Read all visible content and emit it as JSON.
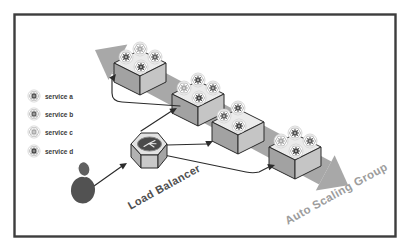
{
  "diagram": {
    "type": "architecture-diagram",
    "legend": {
      "items": [
        {
          "id": "service-a",
          "label": "service a",
          "gear_color": "#4f4f4f"
        },
        {
          "id": "service-b",
          "label": "service b",
          "gear_color": "#5e5e5e"
        },
        {
          "id": "service-c",
          "label": "service c",
          "gear_color": "#a6a6a6"
        },
        {
          "id": "service-d",
          "label": "service d",
          "gear_color": "#404040"
        }
      ]
    },
    "nodes": {
      "user": {
        "type": "user-silhouette"
      },
      "load_balancer": {
        "label": "Load Balancer"
      },
      "auto_scaling_group": {
        "label": "Auto Scaling Group"
      },
      "instances": [
        {
          "name": "instance-1",
          "services": [
            "service-c",
            "service-a",
            "service-b",
            "service-d"
          ]
        },
        {
          "name": "instance-2",
          "services": [
            "service-a",
            "service-c",
            "service-b",
            "service-d"
          ]
        },
        {
          "name": "instance-3",
          "services": [
            "service-a",
            "service-b",
            "service-d"
          ]
        },
        {
          "name": "instance-4",
          "services": [
            "service-a",
            "service-c",
            "service-b",
            "service-d"
          ]
        }
      ]
    },
    "edges": [
      {
        "from": "user",
        "to": "load_balancer"
      },
      {
        "from": "load_balancer",
        "to": "instance-1"
      },
      {
        "from": "load_balancer",
        "to": "instance-2"
      },
      {
        "from": "load_balancer",
        "to": "instance-3"
      },
      {
        "from": "load_balancer",
        "to": "instance-4"
      }
    ],
    "colors": {
      "band": "#a8a8a8",
      "box_top": "#ebebeb",
      "box_left": "#a2a2a2",
      "box_right": "#c5c5c5",
      "line": "#2b2b2b",
      "lb_label": "#4f4f4f",
      "asg_label": "#9c9c9c",
      "frame": "#3d3d3d",
      "person": "#565656"
    }
  }
}
